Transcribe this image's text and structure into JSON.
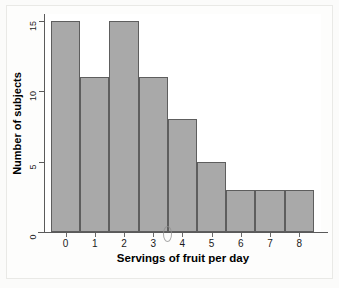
{
  "chart_data": {
    "type": "bar",
    "title": "",
    "xlabel": "Servings of fruit per day",
    "ylabel": "Number of subjects",
    "categories": [
      "0",
      "1",
      "2",
      "3",
      "4",
      "5",
      "6",
      "7",
      "8"
    ],
    "values": [
      15,
      11,
      15,
      11,
      8,
      5,
      3,
      3,
      3
    ],
    "x_tick_labels": [
      "0",
      "1",
      "2",
      "3",
      "4",
      "5",
      "6",
      "7",
      "8"
    ],
    "y_tick_labels": [
      "0",
      "5",
      "10",
      "15"
    ],
    "y_tick_values": [
      0,
      5,
      10,
      15
    ],
    "ylim": [
      0,
      16
    ],
    "grid": false,
    "legend": false,
    "bar_fill_color": "#a9a9a9",
    "bar_edge_color": "#5e5e5e",
    "axis_color": "#5a5a5a",
    "plot_background": "#ffffff",
    "figure_background": "#fbfbfa"
  }
}
